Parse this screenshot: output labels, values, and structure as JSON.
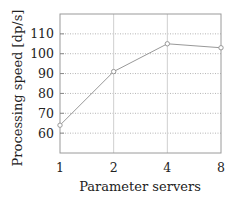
{
  "chart_data": {
    "type": "line",
    "title": "",
    "xlabel": "Parameter servers",
    "ylabel": "Processing speed [dp/s]",
    "categories": [
      "1",
      "2",
      "4",
      "8"
    ],
    "x": [
      1,
      2,
      4,
      8
    ],
    "x_scale": "log2",
    "series": [
      {
        "name": "Processing speed",
        "values": [
          64,
          91,
          105,
          103
        ],
        "color": "#999999",
        "marker": "circle"
      }
    ],
    "yticks": [
      60,
      70,
      80,
      90,
      100,
      110
    ],
    "ylim": [
      50,
      120
    ],
    "xlim": [
      1,
      8
    ],
    "grid": {
      "horizontal": "dotted",
      "vertical": "solid"
    },
    "legend": null
  },
  "labels": {
    "xlabel": "Parameter servers",
    "ylabel": "Processing speed [dp/s]",
    "xticks": [
      "1",
      "2",
      "4",
      "8"
    ],
    "yticks": [
      "60",
      "70",
      "80",
      "90",
      "100",
      "110"
    ]
  }
}
